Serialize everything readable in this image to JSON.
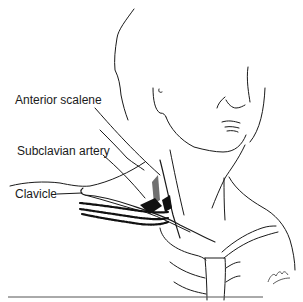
{
  "figure": {
    "type": "anatomical line illustration",
    "labels": [
      {
        "text": "Anterior scalene",
        "x": 15,
        "y": 101
      },
      {
        "text": "Subclavian artery",
        "x": 17,
        "y": 150
      },
      {
        "text": "Clavicle",
        "x": 15,
        "y": 189
      }
    ],
    "signature": "artist signature",
    "colors": {
      "ink": "#1a1a1a",
      "background": "#ffffff"
    }
  }
}
